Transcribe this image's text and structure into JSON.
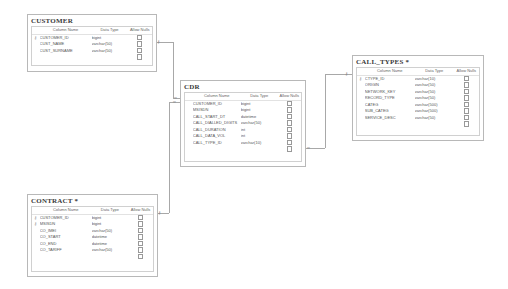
{
  "diagram": {
    "column_headers": {
      "name": "Column Name",
      "type": "Data Type",
      "nulls": "Allow Nulls"
    },
    "tables": {
      "customer": {
        "title": "CUSTOMER",
        "rows": [
          {
            "key": true,
            "name": "CUSTOMER_ID",
            "type": "bigint"
          },
          {
            "key": false,
            "name": "CUST_NAME",
            "type": "varchar(50)"
          },
          {
            "key": false,
            "name": "CUST_SURNAME",
            "type": "varchar(50)"
          },
          {
            "key": false,
            "name": "",
            "type": ""
          }
        ]
      },
      "cdr": {
        "title": "CDR",
        "rows": [
          {
            "key": false,
            "name": "CUSTOMER_ID",
            "type": "bigint"
          },
          {
            "key": false,
            "name": "MSISDN",
            "type": "bigint"
          },
          {
            "key": false,
            "name": "CALL_START_DT",
            "type": "datetime"
          },
          {
            "key": false,
            "name": "CALL_DIALLED_DIGITS",
            "type": "varchar(50)"
          },
          {
            "key": false,
            "name": "CALL_DURATION",
            "type": "int"
          },
          {
            "key": false,
            "name": "CALL_DATA_VOL",
            "type": "int"
          },
          {
            "key": false,
            "name": "CALL_TYPE_ID",
            "type": "varchar(10)"
          },
          {
            "key": false,
            "name": "",
            "type": ""
          }
        ]
      },
      "call_types": {
        "title": "CALL_TYPES *",
        "rows": [
          {
            "key": true,
            "name": "CTYPE_ID",
            "type": "varchar(10)"
          },
          {
            "key": false,
            "name": "ORIGIN",
            "type": "varchar(50)"
          },
          {
            "key": false,
            "name": "NETWORK_KEY",
            "type": "varchar(50)"
          },
          {
            "key": false,
            "name": "RECORD_TYPE",
            "type": "varchar(50)"
          },
          {
            "key": false,
            "name": "CATEG",
            "type": "varchar(500)"
          },
          {
            "key": false,
            "name": "SUB_CATEG",
            "type": "varchar(500)"
          },
          {
            "key": false,
            "name": "SERVICE_DESC",
            "type": "varchar(50)"
          },
          {
            "key": false,
            "name": "",
            "type": ""
          }
        ]
      },
      "contract": {
        "title": "CONTRACT *",
        "rows": [
          {
            "key": true,
            "name": "CUSTOMER_ID",
            "type": "bigint"
          },
          {
            "key": true,
            "name": "MSISDN",
            "type": "bigint"
          },
          {
            "key": false,
            "name": "CO_IMEI",
            "type": "varchar(50)"
          },
          {
            "key": false,
            "name": "CO_START",
            "type": "datetime"
          },
          {
            "key": false,
            "name": "CO_END",
            "type": "datetime"
          },
          {
            "key": false,
            "name": "CO_TARIFF",
            "type": "varchar(50)"
          },
          {
            "key": false,
            "name": "",
            "type": ""
          }
        ]
      }
    },
    "relationships": [
      {
        "from": "CUSTOMER",
        "to": "CDR",
        "from_end": "key",
        "to_end": "∞"
      },
      {
        "from": "CONTRACT",
        "to": "CDR",
        "from_end": "key",
        "to_end": "∞"
      },
      {
        "from": "CALL_TYPES",
        "to": "CDR",
        "from_end": "key",
        "to_end": "∞"
      }
    ],
    "symbols": {
      "key": "⚷",
      "many": "∞",
      "one": "⊸"
    }
  }
}
